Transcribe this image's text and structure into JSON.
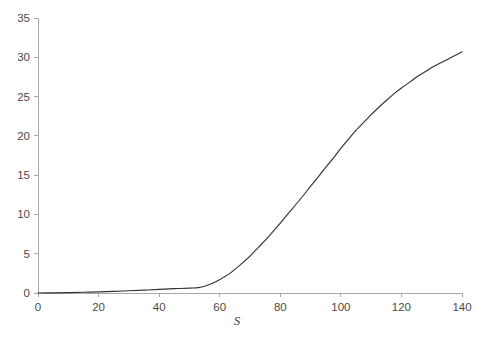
{
  "chart_data": {
    "type": "line",
    "title": "",
    "subtitle": "",
    "xlabel": "S",
    "ylabel": "",
    "xlim": [
      0,
      140
    ],
    "ylim": [
      0,
      35
    ],
    "grid": false,
    "legend": null,
    "legend_position": "none",
    "xticks": [
      0,
      20,
      40,
      60,
      80,
      100,
      120,
      140
    ],
    "yticks": [
      0,
      5,
      10,
      15,
      20,
      25,
      30,
      35
    ],
    "xtick_labels": [
      "0",
      "20",
      "40",
      "60",
      "80",
      "100",
      "120",
      "140"
    ],
    "ytick_labels": [
      "0",
      "5",
      "10",
      "15",
      "20",
      "25",
      "30",
      "35"
    ],
    "series": [
      {
        "name": "curve",
        "color": "#333333",
        "x": [
          0,
          5,
          10,
          15,
          20,
          25,
          30,
          35,
          40,
          45,
          50,
          53,
          55,
          58,
          60,
          63,
          65,
          68,
          70,
          73,
          75,
          78,
          80,
          83,
          85,
          88,
          90,
          93,
          95,
          98,
          100,
          103,
          105,
          108,
          110,
          113,
          115,
          118,
          120,
          123,
          125,
          128,
          130,
          133,
          135,
          138,
          140
        ],
        "y": [
          0.0,
          0.02,
          0.05,
          0.09,
          0.14,
          0.2,
          0.28,
          0.36,
          0.46,
          0.55,
          0.62,
          0.68,
          0.85,
          1.3,
          1.7,
          2.4,
          3.0,
          4.0,
          4.7,
          5.9,
          6.7,
          8.0,
          8.9,
          10.3,
          11.2,
          12.6,
          13.6,
          15.0,
          16.0,
          17.4,
          18.4,
          19.8,
          20.7,
          21.9,
          22.7,
          23.8,
          24.5,
          25.5,
          26.1,
          26.9,
          27.5,
          28.2,
          28.7,
          29.3,
          29.7,
          30.3,
          30.7
        ]
      }
    ]
  },
  "axes": {
    "x_axis_label": "S",
    "y_axis_label": ""
  }
}
